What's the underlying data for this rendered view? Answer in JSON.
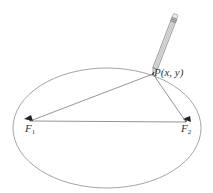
{
  "figure": {
    "type": "ellipse-construction",
    "labels": {
      "point": "P(x, y)",
      "focus1_letter": "F",
      "focus1_sub": "1",
      "focus2_letter": "F",
      "focus2_sub": "2"
    },
    "colors": {
      "ellipse": "#9a9a9a",
      "string": "#7a7a7a",
      "pencil": "#8a8a8a",
      "pin": "#222222",
      "text": "#333333"
    },
    "geometry": {
      "ellipse": {
        "cx": 107,
        "cy": 128,
        "rx": 94,
        "ry": 60
      },
      "point_P": {
        "x": 153,
        "y": 74
      },
      "focus_F1": {
        "x": 30,
        "y": 121
      },
      "focus_F2": {
        "x": 186,
        "y": 122
      }
    }
  }
}
